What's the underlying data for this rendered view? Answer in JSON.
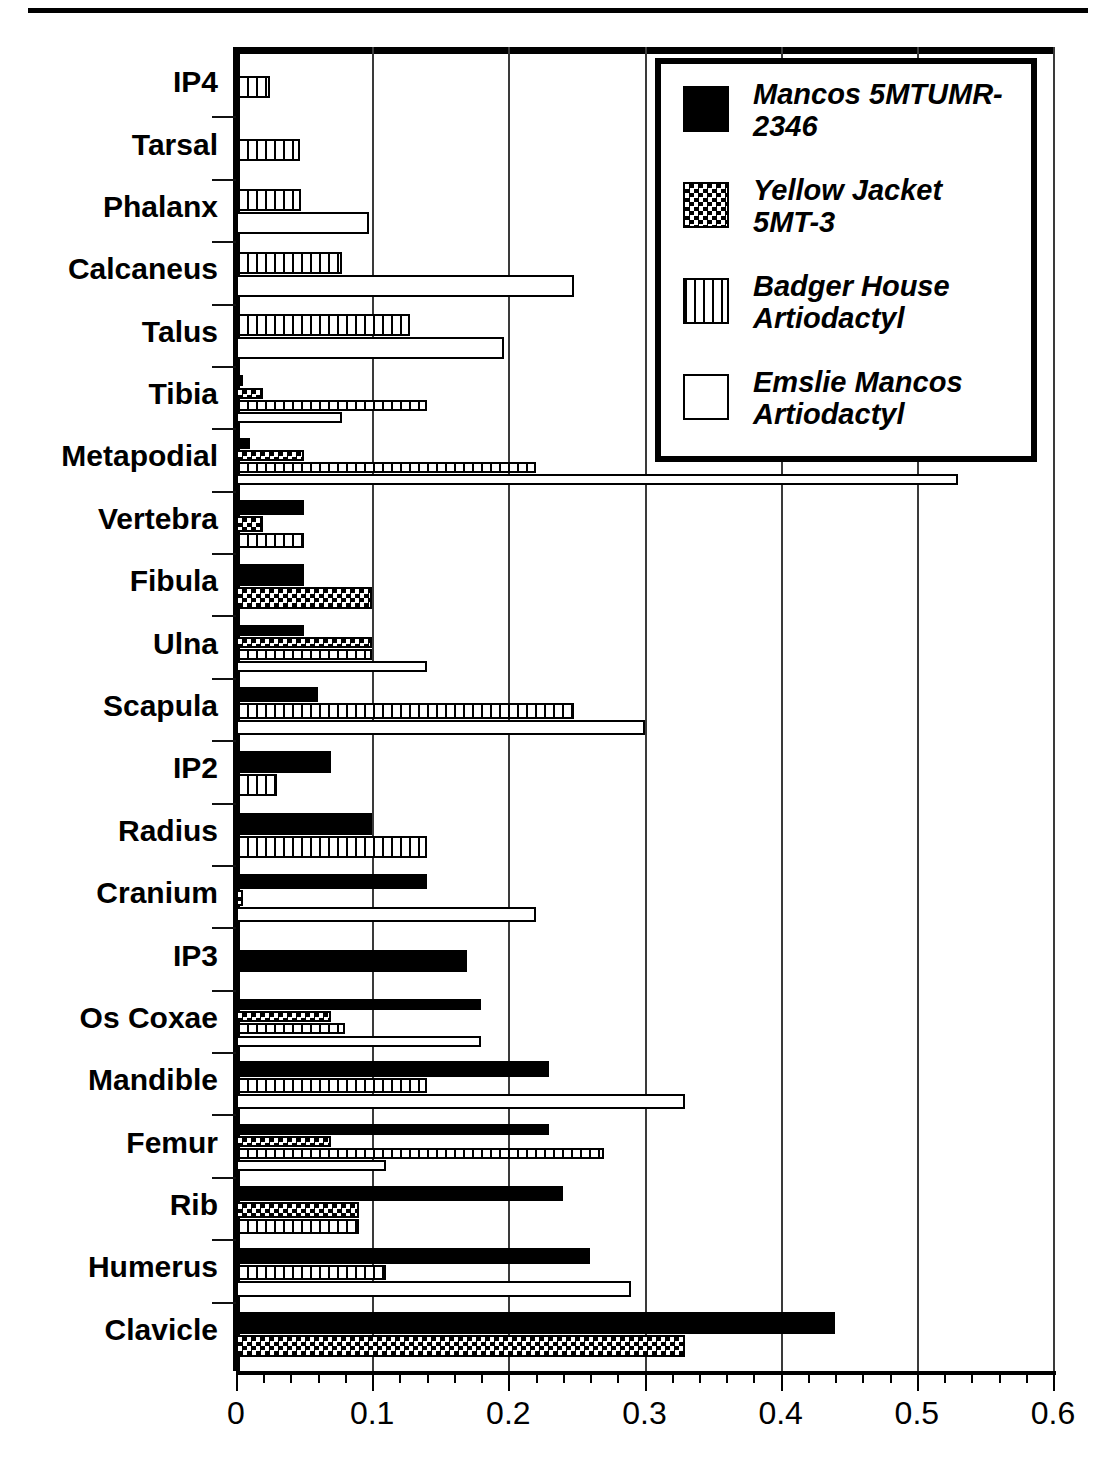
{
  "chart_data": {
    "type": "bar",
    "orientation": "horizontal",
    "title": "",
    "xlabel": "",
    "ylabel": "",
    "xlim": [
      0,
      0.6
    ],
    "xticks": [
      "0",
      "0.1",
      "0.2",
      "0.3",
      "0.4",
      "0.5",
      "0.6"
    ],
    "xtick_values": [
      0,
      0.1,
      0.2,
      0.3,
      0.4,
      0.5,
      0.6
    ],
    "minor_tick_step": 0.02,
    "grid": "vertical-major",
    "legend_position": "top-right",
    "categories": [
      "IP4",
      "Tarsal",
      "Phalanx",
      "Calcaneus",
      "Talus",
      "Tibia",
      "Metapodial",
      "Vertebra",
      "Fibula",
      "Ulna",
      "Scapula",
      "IP2",
      "Radius",
      "Cranium",
      "IP3",
      "Os Coxae",
      "Mandible",
      "Femur",
      "Rib",
      "Humerus",
      "Clavicle"
    ],
    "series": [
      {
        "name": "Mancos 5MTUMR-2346",
        "pattern": "solid-black",
        "values": [
          0,
          0,
          0,
          0,
          0,
          0.005,
          0.01,
          0.05,
          0.05,
          0.05,
          0.06,
          0.07,
          0.1,
          0.14,
          0.17,
          0.18,
          0.23,
          0.23,
          0.24,
          0.26,
          0.44
        ]
      },
      {
        "name": "Yellow Jacket 5MT-3",
        "pattern": "checkerboard",
        "values": [
          0,
          0,
          0,
          0,
          0,
          0.02,
          0.05,
          0.02,
          0.1,
          0.1,
          0,
          0,
          0,
          0.005,
          0,
          0.07,
          0,
          0.07,
          0.09,
          0,
          0.33
        ]
      },
      {
        "name": "Badger House Artiodactyl",
        "pattern": "vertical-hatch",
        "values": [
          0.025,
          0.047,
          0.048,
          0.078,
          0.128,
          0.14,
          0.22,
          0.05,
          0,
          0.1,
          0.248,
          0.03,
          0.14,
          0,
          0,
          0.08,
          0.14,
          0.27,
          0.09,
          0.11,
          0
        ]
      },
      {
        "name": "Emslie Mancos Artiodactyl",
        "pattern": "white-open",
        "values": [
          0,
          0,
          0.098,
          0.248,
          0.197,
          0.078,
          0.53,
          0,
          0,
          0.14,
          0.3,
          0,
          0,
          0.22,
          0,
          0.18,
          0.33,
          0.11,
          0,
          0.29,
          0
        ]
      }
    ]
  },
  "legend": {
    "entries": [
      {
        "swatch": "solid-black-swatch",
        "line1": "Mancos 5MTUMR-",
        "line2": "2346"
      },
      {
        "swatch": "checker-swatch",
        "line1": "Yellow Jacket",
        "line2": "5MT-3"
      },
      {
        "swatch": "vertical-hatch-swatch",
        "line1": "Badger House",
        "line2": "Artiodactyl"
      },
      {
        "swatch": "white-open-swatch",
        "line1": "Emslie Mancos",
        "line2": "Artiodactyl"
      }
    ]
  },
  "colors": {
    "foreground": "#000000",
    "background": "#ffffff",
    "gridline": "#3a3a3a"
  }
}
